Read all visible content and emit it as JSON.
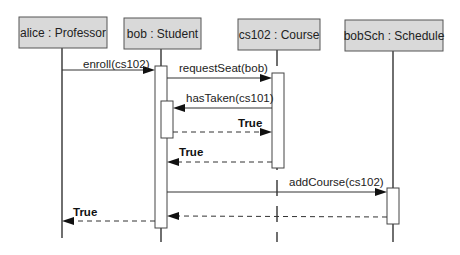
{
  "diagram": {
    "type": "sequence",
    "participants": [
      {
        "id": "alice",
        "label": "alice : Professor"
      },
      {
        "id": "bob",
        "label": "bob : Student"
      },
      {
        "id": "cs102",
        "label": "cs102 : Course"
      },
      {
        "id": "bobSch",
        "label": "bobSch : Schedule"
      }
    ],
    "messages": [
      {
        "from": "alice",
        "to": "bob",
        "label": "enroll(cs102)",
        "kind": "call"
      },
      {
        "from": "bob",
        "to": "cs102",
        "label": "requestSeat(bob)",
        "kind": "call"
      },
      {
        "from": "cs102",
        "to": "bob",
        "label": "hasTaken(cs101)",
        "kind": "call"
      },
      {
        "from": "bob",
        "to": "cs102",
        "label": "True",
        "kind": "return"
      },
      {
        "from": "cs102",
        "to": "bob",
        "label": "True",
        "kind": "return"
      },
      {
        "from": "bob",
        "to": "bobSch",
        "label": "addCourse(cs102)",
        "kind": "call"
      },
      {
        "from": "bobSch",
        "to": "bob",
        "label": "",
        "kind": "return"
      },
      {
        "from": "bob",
        "to": "alice",
        "label": "True",
        "kind": "return"
      }
    ]
  }
}
